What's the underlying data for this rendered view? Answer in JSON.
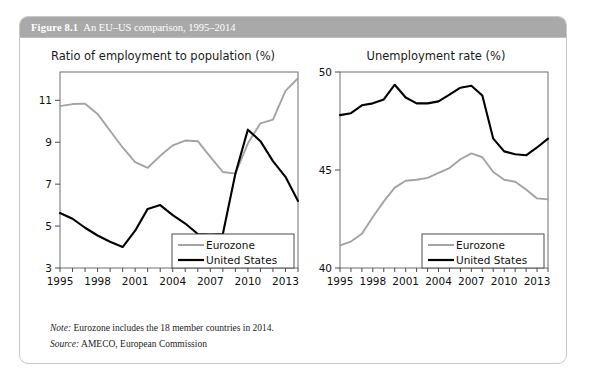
{
  "figure": {
    "number_label": "Figure 8.1",
    "caption": "An EU–US comparison, 1995–2014",
    "header_bg": "#a9a9a9",
    "note_label": "Note:",
    "note_text": "Eurozone includes the 18 member countries in 2014.",
    "source_label": "Source:",
    "source_text": "AMECO, European Commission"
  },
  "legend": {
    "eurozone_label": "Eurozone",
    "united_states_label": "United States",
    "eurozone_color": "#a3a3a3",
    "united_states_color": "#000000"
  },
  "chart_data": [
    {
      "type": "line",
      "panel": "left",
      "title": "Ratio of employment to population (%)",
      "xlabel": "",
      "ylabel": "",
      "x": [
        1995,
        1996,
        1997,
        1998,
        1999,
        2000,
        2001,
        2002,
        2003,
        2004,
        2005,
        2006,
        2007,
        2008,
        2009,
        2010,
        2011,
        2012,
        2013,
        2014
      ],
      "xticks": [
        1995,
        1998,
        2001,
        2004,
        2007,
        2010,
        2013
      ],
      "yticks": [
        3,
        5,
        7,
        9,
        11
      ],
      "xlim": [
        1995,
        2014
      ],
      "ylim": [
        3,
        12.35
      ],
      "grid": false,
      "legend_position": "bottom-right",
      "series": [
        {
          "name": "Eurozone",
          "color": "#a3a3a3",
          "values": [
            10.72,
            10.82,
            10.84,
            10.35,
            9.55,
            8.75,
            8.05,
            7.78,
            8.35,
            8.85,
            9.08,
            9.05,
            8.3,
            7.58,
            7.5,
            8.95,
            9.9,
            10.08,
            11.45,
            12.05
          ]
        },
        {
          "name": "United States",
          "color": "#000000",
          "values": [
            5.62,
            5.35,
            4.92,
            4.55,
            4.25,
            4.0,
            4.78,
            5.82,
            6.0,
            5.52,
            5.12,
            4.62,
            4.6,
            4.62,
            7.5,
            9.6,
            9.05,
            8.1,
            7.35,
            6.2
          ]
        }
      ]
    },
    {
      "type": "line",
      "panel": "right",
      "title": "Unemployment rate (%)",
      "xlabel": "",
      "ylabel": "",
      "x": [
        1995,
        1996,
        1997,
        1998,
        1999,
        2000,
        2001,
        2002,
        2003,
        2004,
        2005,
        2006,
        2007,
        2008,
        2009,
        2010,
        2011,
        2012,
        2013,
        2014
      ],
      "xticks": [
        1995,
        1998,
        2001,
        2004,
        2007,
        2010,
        2013
      ],
      "yticks": [
        40,
        45,
        50
      ],
      "xlim": [
        1995,
        2014
      ],
      "ylim": [
        40,
        50
      ],
      "grid": false,
      "legend_position": "bottom-right",
      "series": [
        {
          "name": "Eurozone",
          "color": "#a3a3a3",
          "values": [
            41.15,
            41.35,
            41.75,
            42.6,
            43.4,
            44.1,
            44.45,
            44.5,
            44.6,
            44.85,
            45.1,
            45.55,
            45.85,
            45.65,
            44.9,
            44.5,
            44.4,
            44.0,
            43.55,
            43.5
          ]
        },
        {
          "name": "United States",
          "color": "#000000",
          "values": [
            47.8,
            47.9,
            48.3,
            48.4,
            48.6,
            49.35,
            48.7,
            48.4,
            48.4,
            48.5,
            48.85,
            49.2,
            49.3,
            48.8,
            46.6,
            45.95,
            45.8,
            45.75,
            46.15,
            46.6
          ]
        }
      ]
    }
  ]
}
